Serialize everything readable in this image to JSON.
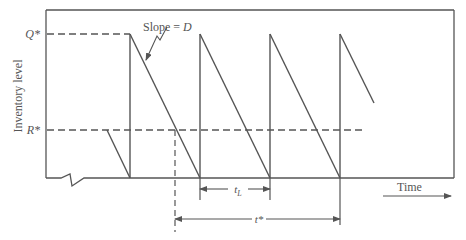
{
  "diagram": {
    "y_axis_label": "Inventory level",
    "x_axis_label": "Time",
    "q_label": "Q*",
    "r_label": "R*",
    "slope_label": "Slope = D",
    "lead_time_label": "tL",
    "lead_time_main": "t",
    "lead_time_sub": "L",
    "cycle_label": "t*",
    "line_color": "#555555",
    "frame": {
      "left": 46,
      "top": 10,
      "right": 454,
      "bottom": 178
    },
    "levels": {
      "q_star_y": 34,
      "r_star_y": 130
    },
    "cycles": [
      {
        "peak_x": 130,
        "empty_x": 200
      },
      {
        "peak_x": 200,
        "empty_x": 270
      },
      {
        "peak_x": 270,
        "empty_x": 340
      },
      {
        "peak_x": 340,
        "partial_end_x": 374,
        "partial_end_y": 103
      }
    ]
  }
}
